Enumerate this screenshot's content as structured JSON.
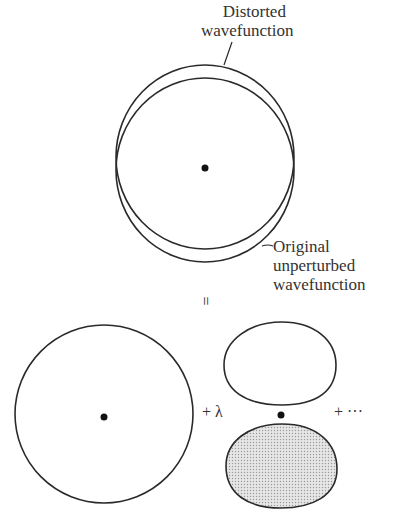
{
  "labels": {
    "distorted": [
      "Distorted",
      "wavefunction"
    ],
    "original": [
      "Original",
      "unperturbed",
      "wavefunction"
    ]
  },
  "equation": {
    "equals": "=",
    "plus_lambda": "+ λ",
    "plus_ellipsis": "+ ···"
  },
  "colors": {
    "stroke": "#2a2a2a",
    "shade": "#d8d8d8",
    "background": "#ffffff"
  }
}
